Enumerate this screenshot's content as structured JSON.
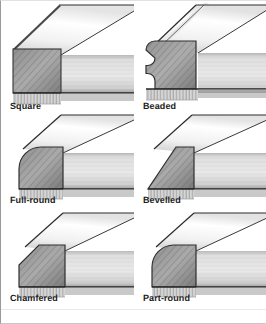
{
  "figure": {
    "background_color": "#ffffff",
    "border_color": "#9a9a9a",
    "label_color": "#1b1b1b",
    "columns": 2,
    "rows": 3
  },
  "palette": {
    "top_face_light": "#fbfbfb",
    "top_face_shade": "#c9c9c9",
    "front_face_light": "#e6e6e6",
    "front_face_dark": "#9c9c9c",
    "end_grain_light": "#b4b4b4",
    "end_grain_dark": "#6f6f6f",
    "underside": "#cfcfcf",
    "outline": "#2a2a2a",
    "shadow": "#8d8d8d"
  },
  "panels": [
    {
      "id": "square",
      "label": "Square",
      "profile": "square",
      "description": "Sharp un-shaped right-angle edge",
      "row": 1,
      "column": 1
    },
    {
      "id": "beaded",
      "label": "Beaded",
      "profile": "beaded",
      "description": "Rounded bead with quirk below the edge",
      "row": 1,
      "column": 2
    },
    {
      "id": "full-round",
      "label": "Full-round",
      "profile": "full-round",
      "description": "Edge rounded over to a full semicircle",
      "row": 2,
      "column": 1
    },
    {
      "id": "bevelled",
      "label": "Bevelled",
      "profile": "bevelled",
      "description": "Long flat angled cut across the edge",
      "row": 2,
      "column": 2
    },
    {
      "id": "chamfered",
      "label": "Chamfered",
      "profile": "chamfered",
      "description": "Small 45 degree flat cut at the corner",
      "row": 3,
      "column": 1
    },
    {
      "id": "part-round",
      "label": "Part-round",
      "profile": "part-round",
      "description": "Corner rounded to a partial radius",
      "row": 3,
      "column": 2
    }
  ]
}
